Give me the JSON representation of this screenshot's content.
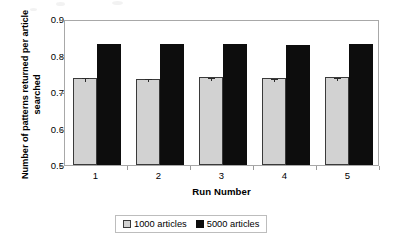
{
  "chart_data": {
    "type": "bar",
    "title": "",
    "xlabel": "Run Number",
    "ylabel": "Number of patterns returned per article searched",
    "categories": [
      "1",
      "2",
      "3",
      "4",
      "5"
    ],
    "ylim": [
      0.5,
      0.9
    ],
    "yticks": [
      "0.5",
      "0.6",
      "0.7",
      "0.8",
      "0.9"
    ],
    "ytick_values": [
      0.5,
      0.6,
      0.7,
      0.8,
      0.9
    ],
    "grid": false,
    "legend_position": "bottom",
    "series": [
      {
        "name": "1000 articles",
        "color": "#d2d2d2",
        "values": [
          0.739,
          0.737,
          0.741,
          0.738,
          0.74
        ],
        "errors": [
          0.004,
          0.004,
          0.004,
          0.004,
          0.005
        ]
      },
      {
        "name": "5000 articles",
        "color": "#0d0d0d",
        "values": [
          0.831,
          0.832,
          0.832,
          0.83,
          0.832
        ],
        "errors": [
          0,
          0,
          0,
          0,
          0
        ]
      }
    ]
  },
  "legend": {
    "items": [
      {
        "label": "1000 articles",
        "swatch": "light"
      },
      {
        "label": "5000 articles",
        "swatch": "dark"
      }
    ]
  },
  "colors": {
    "series_light": "#d2d2d2",
    "series_dark": "#0d0d0d",
    "axis": "#a8a8a8",
    "text": "#000000"
  }
}
